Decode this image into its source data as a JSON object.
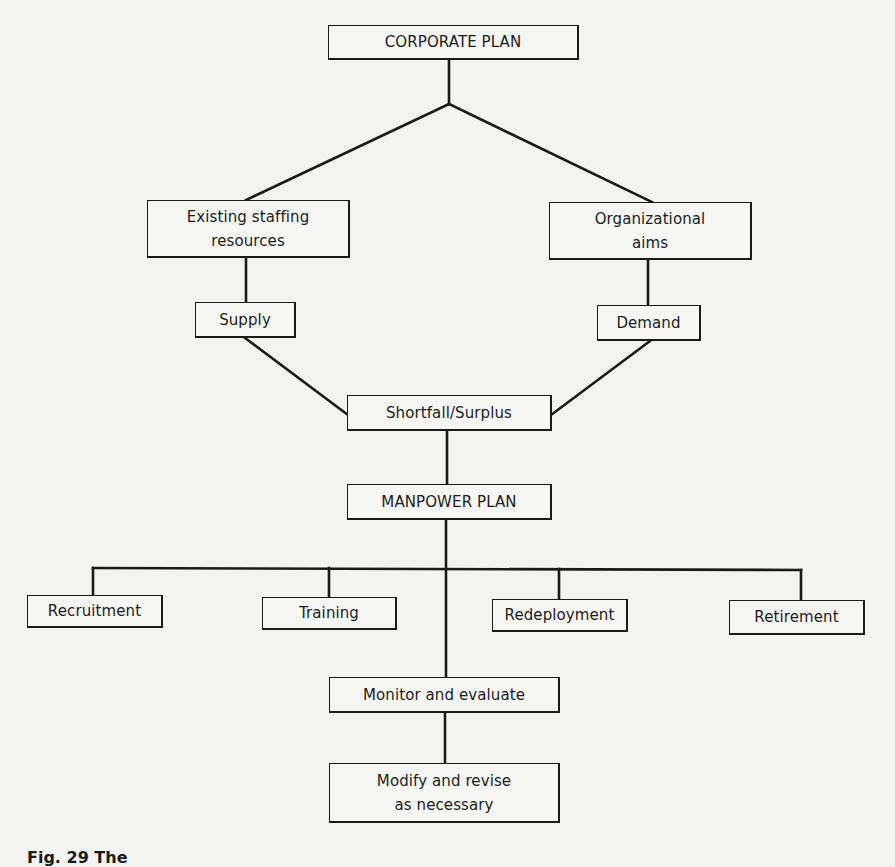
{
  "diagram": {
    "type": "flowchart",
    "nodes": {
      "corporate_plan": {
        "label": "CORPORATE PLAN"
      },
      "existing_staffing": {
        "label_line1": "Existing staffing",
        "label_line2": "resources"
      },
      "organizational_aims": {
        "label_line1": "Organizational",
        "label_line2": "aims"
      },
      "supply": {
        "label": "Supply"
      },
      "demand": {
        "label": "Demand"
      },
      "shortfall_surplus": {
        "label": "Shortfall/Surplus"
      },
      "manpower_plan": {
        "label": "MANPOWER PLAN"
      },
      "recruitment": {
        "label": "Recruitment"
      },
      "training": {
        "label": "Training"
      },
      "redeployment": {
        "label": "Redeployment"
      },
      "retirement": {
        "label": "Retirement"
      },
      "monitor_evaluate": {
        "label": "Monitor and evaluate"
      },
      "modify_revise": {
        "label_line1": "Modify and revise",
        "label_line2": "as necessary"
      }
    },
    "edges": [
      [
        "CORPORATE PLAN",
        "Existing staffing resources"
      ],
      [
        "CORPORATE PLAN",
        "Organizational aims"
      ],
      [
        "Existing staffing resources",
        "Supply"
      ],
      [
        "Organizational aims",
        "Demand"
      ],
      [
        "Supply",
        "Shortfall/Surplus"
      ],
      [
        "Demand",
        "Shortfall/Surplus"
      ],
      [
        "Shortfall/Surplus",
        "MANPOWER PLAN"
      ],
      [
        "MANPOWER PLAN",
        "Recruitment"
      ],
      [
        "MANPOWER PLAN",
        "Training"
      ],
      [
        "MANPOWER PLAN",
        "Redeployment"
      ],
      [
        "MANPOWER PLAN",
        "Retirement"
      ],
      [
        "MANPOWER PLAN",
        "Monitor and evaluate"
      ],
      [
        "Monitor and evaluate",
        "Modify and revise as necessary"
      ]
    ],
    "caption": "Fig. 29  The"
  },
  "colors": {
    "background": "#f3f3f1",
    "line": "#1a1a1a",
    "box_fill": "#f6f6f4"
  }
}
